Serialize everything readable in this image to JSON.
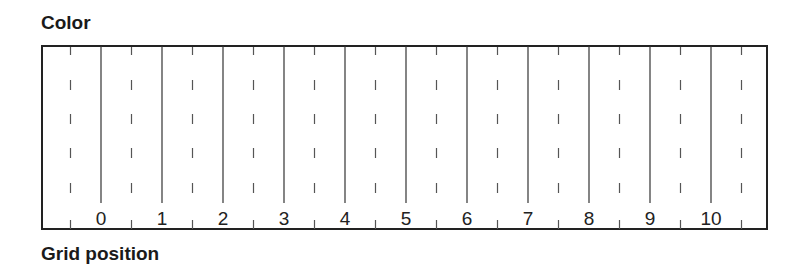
{
  "diagram": {
    "title": "Color",
    "xlabel": "Grid position",
    "tick_labels": [
      "0",
      "1",
      "2",
      "3",
      "4",
      "5",
      "6",
      "7",
      "8",
      "9",
      "10"
    ],
    "colors": {
      "line": "#222222",
      "background": "#ffffff"
    }
  }
}
